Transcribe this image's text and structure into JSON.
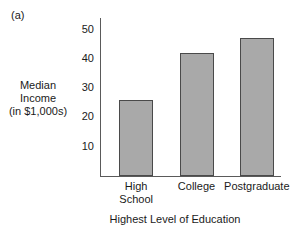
{
  "panel": {
    "label": "(a)"
  },
  "chart_data": {
    "type": "bar",
    "title": "",
    "subtitle": "",
    "categories": [
      "High\nSchool",
      "College",
      "Postgraduate"
    ],
    "values": [
      26,
      42,
      47
    ],
    "xlabel": "Highest Level of Education",
    "ylabel_lines": [
      "Median",
      "Income",
      "(in $1,000s)"
    ],
    "ylabel": "Median Income (in $1,000s)",
    "yticks": [
      50,
      40,
      30,
      20,
      10
    ],
    "ylim": [
      0,
      54
    ],
    "xlim": [
      0,
      3
    ],
    "grid": false,
    "legend": null,
    "bar_color": "#a9a9a9",
    "bar_edge_color": "#4a4a4a",
    "axis_color": "#5a5a5a",
    "text_color": "#1a1a1a",
    "background": "#ffffff"
  }
}
